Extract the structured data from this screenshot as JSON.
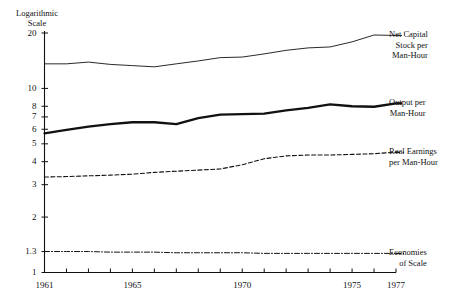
{
  "chart_data": {
    "type": "line",
    "title": "",
    "subtitle": "",
    "xlabel": "",
    "ylabel": "Logarithmic Scale",
    "ylabel_lines": [
      "Logarithmic",
      "Scale"
    ],
    "yscale": "log",
    "ylim": [
      1,
      20
    ],
    "yticks": [
      20,
      10,
      8,
      7,
      6,
      5,
      4,
      3,
      2,
      1.3,
      1
    ],
    "ytick_labels": [
      "20",
      "10",
      "8",
      "7",
      "6",
      "5",
      "4",
      "3",
      "2",
      "1.3",
      "1"
    ],
    "xlim": [
      1961,
      1977
    ],
    "xticks": [
      1961,
      1962,
      1963,
      1964,
      1965,
      1966,
      1967,
      1968,
      1969,
      1970,
      1971,
      1972,
      1973,
      1974,
      1975,
      1976,
      1977
    ],
    "xtick_labels_shown": [
      "1961",
      "1965",
      "1970",
      "1975",
      "1977"
    ],
    "xtick_labels_shown_at": [
      1961,
      1965,
      1970,
      1975,
      1977
    ],
    "grid": false,
    "legend_position": "right-inline",
    "x": [
      1961,
      1962,
      1963,
      1964,
      1965,
      1966,
      1967,
      1968,
      1969,
      1970,
      1971,
      1972,
      1973,
      1974,
      1975,
      1976,
      1977
    ],
    "series": [
      {
        "name": "Net Capital Stock per Man-Hour",
        "label_lines": [
          "Net Capital",
          "Stock per",
          "Man-Hour"
        ],
        "style": "solid-thin",
        "values": [
          13.6,
          13.6,
          13.9,
          13.5,
          13.3,
          13.1,
          13.6,
          14.1,
          14.7,
          14.8,
          15.4,
          16.1,
          16.6,
          16.8,
          17.9,
          19.5,
          19.4
        ]
      },
      {
        "name": "Output per Man-Hour",
        "label_lines": [
          "Output per",
          "Man-Hour"
        ],
        "style": "solid-thick",
        "values": [
          5.7,
          5.95,
          6.2,
          6.4,
          6.55,
          6.55,
          6.4,
          6.9,
          7.2,
          7.25,
          7.3,
          7.6,
          7.85,
          8.2,
          8.0,
          7.95,
          8.3
        ]
      },
      {
        "name": "Real Earnings per Man-Hour",
        "label_lines": [
          "Real Earnings",
          "per Man-Hour"
        ],
        "style": "dashed",
        "values": [
          3.3,
          3.32,
          3.35,
          3.38,
          3.42,
          3.5,
          3.55,
          3.6,
          3.65,
          3.85,
          4.15,
          4.3,
          4.35,
          4.35,
          4.38,
          4.42,
          4.5
        ]
      },
      {
        "name": "Economies of Scale",
        "label_lines": [
          "Economies",
          "of Scale"
        ],
        "style": "dash-dot",
        "values": [
          1.3,
          1.3,
          1.3,
          1.29,
          1.29,
          1.29,
          1.28,
          1.28,
          1.28,
          1.28,
          1.27,
          1.27,
          1.27,
          1.27,
          1.27,
          1.27,
          1.27
        ]
      }
    ]
  },
  "axes": {
    "y_title_line1": "Logarithmic",
    "y_title_line2": "Scale",
    "ytick_0": "20",
    "ytick_1": "10",
    "ytick_2": "8",
    "ytick_3": "7",
    "ytick_4": "6",
    "ytick_5": "5",
    "ytick_6": "4",
    "ytick_7": "3",
    "ytick_8": "2",
    "ytick_9": "1.3",
    "ytick_10": "1",
    "xtick_1961": "1961",
    "xtick_1965": "1965",
    "xtick_1970": "1970",
    "xtick_1975": "1975",
    "xtick_1977": "1977"
  },
  "legend": {
    "net_capital": {
      "line1": "Net Capital",
      "line2": "Stock per",
      "line3": "Man-Hour"
    },
    "output": {
      "line1": "Output per",
      "line2": "Man-Hour"
    },
    "real_earnings": {
      "line1": "Real Earnings",
      "line2": "per Man-Hour"
    },
    "economies": {
      "line1": "Economies",
      "line2": "of Scale"
    }
  },
  "colors": {
    "ink": "#111111",
    "background": "#ffffff"
  }
}
